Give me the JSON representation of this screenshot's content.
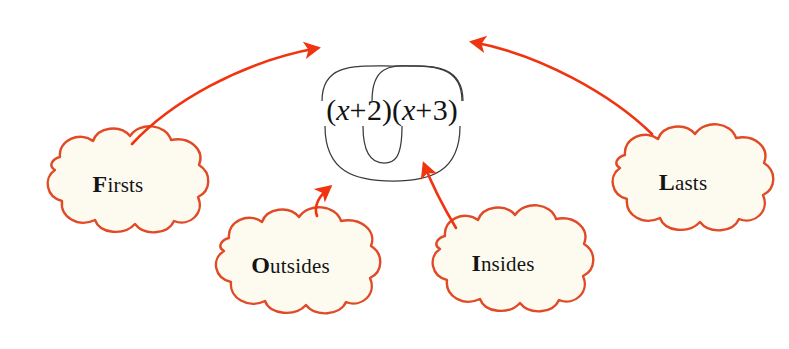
{
  "diagram": {
    "name": "FOIL method diagram",
    "expression": {
      "full": "(x + 2)(x + 3)",
      "left_factor": "(x + 2)",
      "right_factor": "(x + 3)",
      "variable": "x",
      "operator": "+",
      "left_constant": "2",
      "right_constant": "3",
      "open_paren": "(",
      "close_paren": ")"
    },
    "colors": {
      "cloud_outline": "#E04A26",
      "cloud_fill": "#FDFBF0",
      "arrow": "#F03410",
      "arc": "#3A3A3A",
      "text": "#131313",
      "background": "#FFFFFF"
    },
    "clouds": [
      {
        "id": "firsts",
        "cap": "F",
        "rest": "irsts"
      },
      {
        "id": "outsides",
        "cap": "O",
        "rest": "utsides"
      },
      {
        "id": "insides",
        "cap": "I",
        "rest": "nsides"
      },
      {
        "id": "lasts",
        "cap": "L",
        "rest": "asts"
      }
    ],
    "arcs": [
      {
        "id": "firsts-arc",
        "position": "above",
        "span": "x-to-x",
        "width": "wide"
      },
      {
        "id": "outsides-arc",
        "position": "above",
        "span": "x-to-3",
        "width": "narrow"
      },
      {
        "id": "insides-arc",
        "position": "below",
        "span": "2-to-x",
        "width": "narrow"
      },
      {
        "id": "lasts-arc",
        "position": "below",
        "span": "2-to-3",
        "width": "wide"
      }
    ],
    "arrows": [
      {
        "id": "firsts-arrow",
        "from": "firsts",
        "direction": "up-right"
      },
      {
        "id": "lasts-arrow",
        "from": "lasts",
        "direction": "up-left"
      },
      {
        "id": "outsides-arrow",
        "from": "outsides",
        "direction": "up-right"
      },
      {
        "id": "insides-arrow",
        "from": "insides",
        "direction": "up-left"
      }
    ]
  }
}
